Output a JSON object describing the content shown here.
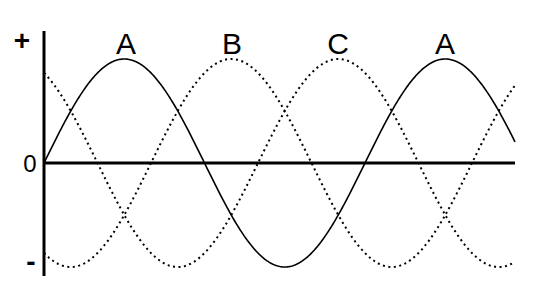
{
  "diagram": {
    "axis_labels": {
      "positive": "+",
      "zero": "0",
      "negative": "-"
    },
    "phase_labels": [
      {
        "text": "A",
        "x": 124
      },
      {
        "text": "B",
        "x": 232
      },
      {
        "text": "C",
        "x": 338
      },
      {
        "text": "A",
        "x": 445
      }
    ],
    "series": [
      {
        "name": "A",
        "style": "solid",
        "phase_deg": 0
      },
      {
        "name": "B",
        "style": "dotted",
        "phase_deg": -120
      },
      {
        "name": "C",
        "style": "dotted",
        "phase_deg": -240
      }
    ],
    "geometry": {
      "x0": 44,
      "x_end": 515,
      "baseline_y": 163,
      "amplitude": 104,
      "period_px": 321
    },
    "colors": {
      "line": "#000000",
      "background": "#ffffff"
    }
  }
}
